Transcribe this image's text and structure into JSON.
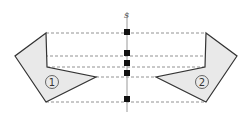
{
  "diagram": {
    "axis_label": "s",
    "shape_left_label": "1",
    "shape_right_label": "2",
    "colors": {
      "shape_fill": "#e9e9e9",
      "shape_stroke": "#333333",
      "axis": "#999999",
      "dashes": "#777777",
      "markers": "#111111"
    },
    "marker_count": 5
  }
}
